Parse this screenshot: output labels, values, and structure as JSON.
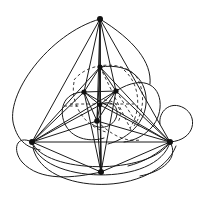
{
  "figure": {
    "type": "graph-drawing",
    "background_color": "#ffffff",
    "stroke_color": "#1a1a1a",
    "dashed_stroke_color": "#3a3a3a",
    "vertex_color": "#111111",
    "canvas": {
      "width": 201,
      "height": 208
    }
  },
  "graph_data": {
    "type": "node-link-diagram",
    "vertex_count": 9,
    "vertices": [
      {
        "id": "apex",
        "label": "",
        "x": 100,
        "y": 19,
        "r": 3.0
      },
      {
        "id": "outer-left",
        "label": "",
        "x": 32,
        "y": 142,
        "r": 3.0
      },
      {
        "id": "outer-right",
        "label": "",
        "x": 170,
        "y": 142,
        "r": 3.0
      },
      {
        "id": "outer-bottom",
        "label": "",
        "x": 101,
        "y": 172,
        "r": 3.0
      },
      {
        "id": "inner-top",
        "label": "",
        "x": 100,
        "y": 67,
        "r": 2.6
      },
      {
        "id": "inner-left",
        "label": "",
        "x": 84,
        "y": 92,
        "r": 2.6
      },
      {
        "id": "inner-right",
        "label": "",
        "x": 116,
        "y": 91,
        "r": 2.6
      },
      {
        "id": "inner-center",
        "label": "",
        "x": 100,
        "y": 105,
        "r": 2.2
      },
      {
        "id": "inner-bottom",
        "label": "",
        "x": 97,
        "y": 121,
        "r": 2.8
      }
    ],
    "straight_edges": [
      [
        "apex",
        "outer-left"
      ],
      [
        "apex",
        "outer-right"
      ],
      [
        "apex",
        "outer-bottom"
      ],
      [
        "apex",
        "inner-top"
      ],
      [
        "apex",
        "inner-left"
      ],
      [
        "apex",
        "inner-right"
      ],
      [
        "apex",
        "inner-center"
      ],
      [
        "apex",
        "inner-bottom"
      ],
      [
        "outer-left",
        "outer-right"
      ],
      [
        "outer-left",
        "outer-bottom"
      ],
      [
        "outer-left",
        "inner-top"
      ],
      [
        "outer-left",
        "inner-left"
      ],
      [
        "outer-left",
        "inner-right"
      ],
      [
        "outer-left",
        "inner-center"
      ],
      [
        "outer-left",
        "inner-bottom"
      ],
      [
        "outer-right",
        "outer-bottom"
      ],
      [
        "outer-right",
        "inner-top"
      ],
      [
        "outer-right",
        "inner-left"
      ],
      [
        "outer-right",
        "inner-right"
      ],
      [
        "outer-right",
        "inner-center"
      ],
      [
        "outer-right",
        "inner-bottom"
      ],
      [
        "outer-bottom",
        "inner-top"
      ],
      [
        "outer-bottom",
        "inner-left"
      ],
      [
        "outer-bottom",
        "inner-right"
      ],
      [
        "outer-bottom",
        "inner-center"
      ],
      [
        "outer-bottom",
        "inner-bottom"
      ],
      [
        "inner-top",
        "inner-left"
      ],
      [
        "inner-top",
        "inner-right"
      ],
      [
        "inner-top",
        "inner-center"
      ],
      [
        "inner-top",
        "inner-bottom"
      ],
      [
        "inner-left",
        "inner-right"
      ],
      [
        "inner-left",
        "inner-center"
      ],
      [
        "inner-left",
        "inner-bottom"
      ],
      [
        "inner-right",
        "inner-center"
      ],
      [
        "inner-right",
        "inner-bottom"
      ],
      [
        "inner-center",
        "inner-bottom"
      ]
    ],
    "curved_edges": [
      {
        "id": "left-outer-loop",
        "path": "M 100 19 C 48 34 4 96 14 126 C 20 146 32 148 40 150"
      },
      {
        "id": "left-lower-loop",
        "path": "M 32 142 C 16 134 12 150 22 162 C 40 182 74 178 101 172"
      },
      {
        "id": "bottom-arc-1",
        "path": "M 32 142 C 44 174 150 176 170 142"
      },
      {
        "id": "bottom-arc-2",
        "path": "M 32 142 C 40 184 158 188 170 142"
      },
      {
        "id": "bottom-arc-3",
        "path": "M 33 148 C 44 196 156 198 176 146"
      },
      {
        "id": "right-outer-loop",
        "path": "M 170 142 C 196 140 198 116 184 108 C 170 100 158 112 160 124"
      },
      {
        "id": "right-lower-loop",
        "path": "M 170 142 C 180 158 162 172 140 176"
      },
      {
        "id": "inner-right-loop-1",
        "path": "M 116 91 C 146 72 162 88 160 108 C 158 128 140 140 124 142"
      },
      {
        "id": "inner-right-loop-2",
        "path": "M 100 67 C 132 62 148 82 146 104 C 144 126 124 140 108 144"
      },
      {
        "id": "inner-left-loop",
        "path": "M 84 92 C 62 92 58 112 66 126 C 74 140 92 142 104 138"
      },
      {
        "id": "center-small-loop",
        "path": "M 100 105 C 112 98 120 108 116 118 C 112 128 98 130 92 124"
      },
      {
        "id": "upper-right-sweep",
        "path": "M 100 19 C 134 40 152 62 150 84"
      },
      {
        "id": "right-tail",
        "path": "M 170 142 C 158 154 144 162 128 166"
      }
    ],
    "dashed_edges": [
      {
        "id": "dash-upper-arc",
        "path": "M 74 80 C 88 62 122 60 136 76"
      },
      {
        "id": "dash-right-arc-1",
        "path": "M 136 76 C 146 92 144 112 134 126"
      },
      {
        "id": "dash-right-arc-2",
        "path": "M 124 70 C 140 84 142 110 130 128"
      },
      {
        "id": "dash-lower-arc",
        "path": "M 74 82 C 70 104 84 126 106 132"
      },
      {
        "id": "dash-center-h",
        "path": "M 70 104 L 134 104"
      },
      {
        "id": "dash-diag-1",
        "path": "M 116 91 L 140 128"
      },
      {
        "id": "dash-diag-2",
        "path": "M 100 67 L 132 132"
      },
      {
        "id": "dash-small-arc",
        "path": "M 104 100 C 118 100 124 112 118 122"
      },
      {
        "id": "dash-bottom-tail",
        "path": "M 97 121 C 112 136 126 142 140 140"
      },
      {
        "id": "dash-left-tick",
        "path": "M 64 106 L 80 106"
      }
    ]
  }
}
